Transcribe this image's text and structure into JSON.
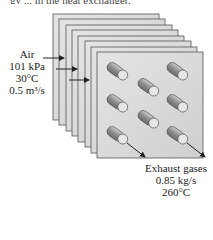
{
  "caption_fragment": "gy ... in the heat exchanger.",
  "inlet": {
    "title": "Air",
    "pressure": "101 kPa",
    "temperature": "30°C",
    "flow_rate": "0.5 m³/s"
  },
  "outlet": {
    "title": "Exhaust gases",
    "mass_flow": "0.85 kg/s",
    "temperature": "260°C"
  },
  "diagram": {
    "plate_count": 8,
    "tube_count": 8,
    "colors": {
      "plate_fill": "#d8d8d8",
      "plate_edge": "#555555",
      "tube_body": "#9a9a9a",
      "tube_cap": "#e6e6e6"
    }
  }
}
